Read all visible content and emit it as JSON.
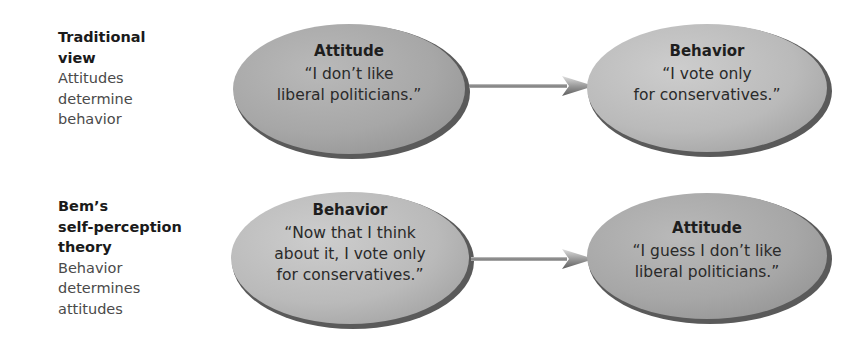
{
  "rows": [
    {
      "label": {
        "title_lines": [
          "Traditional",
          "view"
        ],
        "desc_lines": [
          "Attitudes",
          "determine",
          "behavior"
        ]
      },
      "from": {
        "heading": "Attitude",
        "quote_lines": [
          "“I don’t like",
          "liberal politicians.”"
        ]
      },
      "to": {
        "heading": "Behavior",
        "quote_lines": [
          "“I vote only",
          "for conservatives.”"
        ]
      },
      "arrow": "right-arrow"
    },
    {
      "label": {
        "title_lines": [
          "Bem’s",
          "self-perception",
          "theory"
        ],
        "desc_lines": [
          "Behavior",
          "determines",
          "attitudes"
        ]
      },
      "from": {
        "heading": "Behavior",
        "quote_lines": [
          "“Now that I think",
          "about it, I vote only",
          "for conservatives.”"
        ]
      },
      "to": {
        "heading": "Attitude",
        "quote_lines": [
          "“I guess I don’t like",
          "liberal politicians.”"
        ]
      },
      "arrow": "right-arrow"
    }
  ],
  "colors": {
    "ellipse_fill": "#a9a9a9",
    "ellipse_fill_light": "#c4c4c4",
    "ellipse_rim": "#5a5a5a",
    "arrow": "#8a8a8a"
  }
}
